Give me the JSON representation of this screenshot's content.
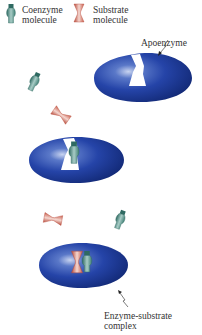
{
  "legend": {
    "coenzyme": {
      "line1": "Coenzyme",
      "line2": "molecule",
      "icon": "coenzyme-molecule-icon"
    },
    "substrate": {
      "line1": "Substrate",
      "line2": "molecule",
      "icon": "substrate-molecule-icon"
    }
  },
  "labels": {
    "apoenzyme": "Apoenzyme",
    "complex_line1": "Enzyme-substrate",
    "complex_line2": "complex"
  },
  "colors": {
    "enzyme_blue": "#1f3f9e",
    "enzyme_dark": "#0f2470",
    "coenzyme_teal": "#3f7f74",
    "substrate_red": "#c9604f",
    "text": "#333333"
  },
  "stages": [
    {
      "name": "apoenzyme",
      "description": "Enzyme with empty active site; free coenzyme and substrate nearby"
    },
    {
      "name": "holoenzyme",
      "description": "Coenzyme bound into active site; substrate approaching"
    },
    {
      "name": "enzyme-substrate-complex",
      "description": "Coenzyme and substrate both bound in active site"
    }
  ]
}
